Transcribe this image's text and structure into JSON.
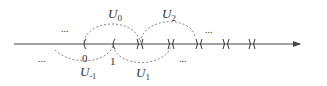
{
  "diagram": {
    "type": "number-line-with-open-cover",
    "axis": {
      "x1": 14,
      "x2": 300,
      "y": 44,
      "arrow": true
    },
    "colors": {
      "line": "#444444",
      "dashed": "#777777",
      "text": "#333333"
    },
    "labels": {
      "u0": "U",
      "u0_sub": "0",
      "u1": "U",
      "u1_sub": "1",
      "u2": "U",
      "u2_sub": "2",
      "um1": "U",
      "um1_sub": "-1",
      "zero": "0",
      "one": "1",
      "dots_top_left": "...",
      "dots_bottom_left": "...",
      "dots_top_right": "...",
      "dots_bottom_right": "..."
    },
    "markers": [
      {
        "x": 84,
        "kind": "paren"
      },
      {
        "x": 113,
        "kind": "paren"
      },
      {
        "x": 140,
        "kind": "cross"
      },
      {
        "x": 171,
        "kind": "cross"
      },
      {
        "x": 199,
        "kind": "cross"
      },
      {
        "x": 226,
        "kind": "cross"
      },
      {
        "x": 252,
        "kind": "cross"
      }
    ]
  }
}
